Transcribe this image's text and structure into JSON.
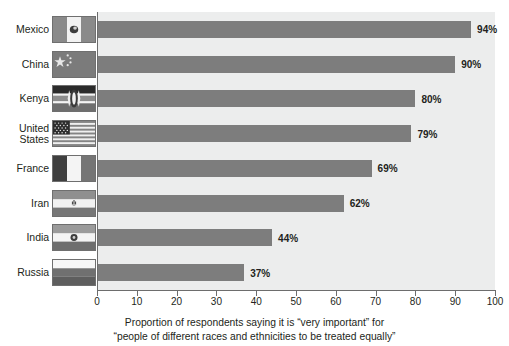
{
  "chart_data": {
    "type": "bar",
    "orientation": "horizontal",
    "title": "",
    "subtitle": "",
    "xlabel": "Proportion of respondents saying it is \"very important\" for \"people of different races and ethnicities to be treated equally\"",
    "ylabel": "",
    "xlim": [
      0,
      100
    ],
    "grid": false,
    "legend": null,
    "categories": [
      "Mexico",
      "China",
      "Kenya",
      "United States",
      "France",
      "Iran",
      "India",
      "Russia"
    ],
    "values": [
      94,
      90,
      80,
      79,
      69,
      62,
      44,
      37
    ],
    "value_labels": [
      "94%",
      "90%",
      "80%",
      "79%",
      "69%",
      "62%",
      "44%",
      "37%"
    ],
    "xticks": [
      0,
      10,
      20,
      30,
      40,
      50,
      60,
      70,
      80,
      90,
      100
    ],
    "xtick_labels": [
      "0",
      "10",
      "20",
      "30",
      "40",
      "50",
      "60",
      "70",
      "80",
      "90",
      "100"
    ],
    "bar_color": "#7d7d7d",
    "plot_background": "#eceded",
    "axis_color": "#6d6d6d",
    "text_color": "#231f20"
  },
  "caption": {
    "line1": "Proportion of respondents saying it is “very important” for",
    "line2": "“people of different races and ethnicities to be treated equally”"
  },
  "rows": [
    {
      "label": "Mexico",
      "label_display": "Mexico",
      "value": 94,
      "value_label": "94%",
      "flag": "flag-mexico"
    },
    {
      "label": "China",
      "label_display": "China",
      "value": 90,
      "value_label": "90%",
      "flag": "flag-china"
    },
    {
      "label": "Kenya",
      "label_display": "Kenya",
      "value": 80,
      "value_label": "80%",
      "flag": "flag-kenya"
    },
    {
      "label": "United States",
      "label_display": "United\nStates",
      "value": 79,
      "value_label": "79%",
      "flag": "flag-united-states"
    },
    {
      "label": "France",
      "label_display": "France",
      "value": 69,
      "value_label": "69%",
      "flag": "flag-france"
    },
    {
      "label": "Iran",
      "label_display": "Iran",
      "value": 62,
      "value_label": "62%",
      "flag": "flag-iran"
    },
    {
      "label": "India",
      "label_display": "India",
      "value": 44,
      "value_label": "44%",
      "flag": "flag-india"
    },
    {
      "label": "Russia",
      "label_display": "Russia",
      "value": 37,
      "value_label": "37%",
      "flag": "flag-russia"
    }
  ]
}
